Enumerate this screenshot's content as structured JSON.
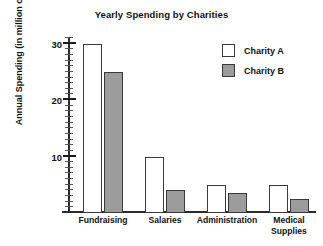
{
  "chart_data": {
    "type": "bar",
    "title": "Yearly Spending by Charities",
    "xlabel": "",
    "ylabel": "Annual Spending (in million of $)",
    "categories": [
      "Fundraising",
      "Salaries",
      "Administration",
      "Medical\nSupplies"
    ],
    "series": [
      {
        "name": "Charity A",
        "values": [
          30,
          10,
          5,
          5
        ],
        "color": "#ffffff"
      },
      {
        "name": "Charity B",
        "values": [
          25,
          4,
          3.5,
          2.5
        ],
        "color": "#9c9c9c"
      }
    ],
    "ylim": [
      0,
      31
    ],
    "ytick_values": [
      10,
      20,
      30
    ],
    "ytick_labels": [
      "10",
      "20",
      "30"
    ],
    "yminor_step": 1,
    "grid": false,
    "legend_position": "top-right"
  },
  "legend": {
    "entries": [
      {
        "label": "Charity A"
      },
      {
        "label": "Charity B"
      }
    ]
  }
}
